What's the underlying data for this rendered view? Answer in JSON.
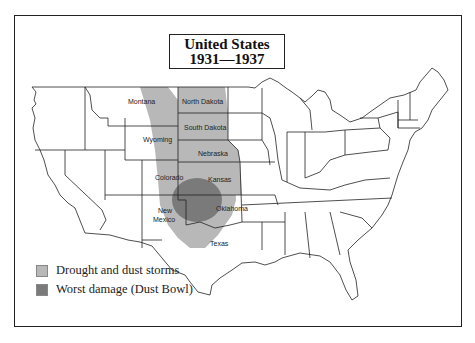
{
  "title": {
    "line1": "United States",
    "line2": "1931—1937"
  },
  "legend": {
    "items": [
      {
        "label": "Drought and dust storms",
        "color": "#b8b8b8"
      },
      {
        "label": "Worst damage (Dust Bowl)",
        "color": "#7a7a7a"
      }
    ]
  },
  "states": {
    "montana": "Montana",
    "north_dakota": "North Dakota",
    "south_dakota": "South Dakota",
    "wyoming": "Wyoming",
    "nebraska": "Nebraska",
    "colorado": "Colorado",
    "kansas": "Kansas",
    "new_mexico_1": "New",
    "new_mexico_2": "Mexico",
    "oklahoma": "Oklahoma",
    "texas": "Texas"
  },
  "colors": {
    "drought": "#b8b8b8",
    "dust_bowl": "#7a7a7a",
    "border": "#222222"
  }
}
